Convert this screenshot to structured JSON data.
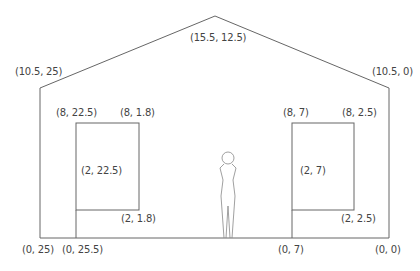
{
  "diagram": {
    "line_color": "#555555",
    "labels": {
      "roof_apex": "(15.5, 12.5)",
      "eave_left": "(10.5, 25)",
      "eave_right": "(10.5, 0)",
      "win_left_top_left": "(8, 22.5)",
      "win_left_top_right": "(8, 1.8)",
      "win_left_mid": "(2, 22.5)",
      "win_left_bottom_right": "(2, 1.8)",
      "win_right_top_left": "(8, 7)",
      "win_right_top_right": "(8, 2.5)",
      "win_right_mid": "(2, 7)",
      "win_right_bottom_right": "(2, 2.5)",
      "ground_left_corner": "(0, 25)",
      "ground_left_window": "(0, 25.5)",
      "ground_right_window": "(0, 7)",
      "ground_right_corner": "(0, 0)"
    }
  }
}
